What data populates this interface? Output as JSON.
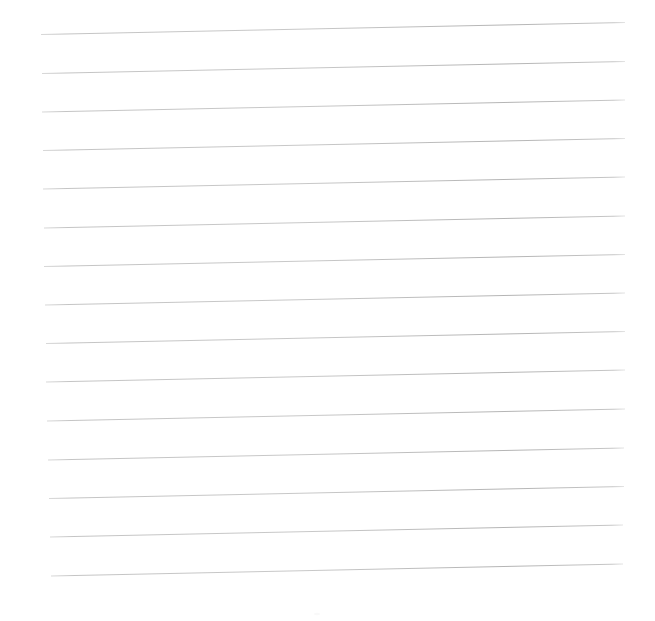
{
  "document": {
    "kind": "scanned-ruled-paper",
    "title": "Blank Ruled Paper",
    "page_label": "",
    "body_text": "",
    "width": 655,
    "height": 621
  },
  "colors": {
    "paper": "#ffffff",
    "rule_line": "#c2c2c2",
    "rule_line_strong": "#b0b0b0",
    "rule_line_faint": "#dcdcdc"
  },
  "ruling": {
    "type": "horizontal-ruled-lines",
    "count": 15,
    "spacing_px": 38.8,
    "stroke_width_px": 1,
    "skew_note": "lines rise slightly toward the right",
    "lines": [
      {
        "index": 1,
        "x1": 41,
        "y1": 34.5,
        "x2": 625,
        "y2": 22.5
      },
      {
        "index": 2,
        "x1": 42,
        "y1": 73.5,
        "x2": 625,
        "y2": 61.5
      },
      {
        "index": 3,
        "x1": 42,
        "y1": 112.0,
        "x2": 625,
        "y2": 100.0
      },
      {
        "index": 4,
        "x1": 43,
        "y1": 150.5,
        "x2": 625,
        "y2": 138.5
      },
      {
        "index": 5,
        "x1": 43,
        "y1": 189.0,
        "x2": 625,
        "y2": 177.0
      },
      {
        "index": 6,
        "x1": 44,
        "y1": 228.0,
        "x2": 625,
        "y2": 216.0
      },
      {
        "index": 7,
        "x1": 44,
        "y1": 266.5,
        "x2": 625,
        "y2": 254.5
      },
      {
        "index": 8,
        "x1": 45,
        "y1": 305.0,
        "x2": 625,
        "y2": 293.0
      },
      {
        "index": 9,
        "x1": 46,
        "y1": 343.5,
        "x2": 625,
        "y2": 331.5
      },
      {
        "index": 10,
        "x1": 46,
        "y1": 382.0,
        "x2": 625,
        "y2": 370.0
      },
      {
        "index": 11,
        "x1": 47,
        "y1": 421.0,
        "x2": 625,
        "y2": 409.0
      },
      {
        "index": 12,
        "x1": 48,
        "y1": 460.0,
        "x2": 624,
        "y2": 448.0
      },
      {
        "index": 13,
        "x1": 49,
        "y1": 498.5,
        "x2": 624,
        "y2": 486.5
      },
      {
        "index": 14,
        "x1": 50,
        "y1": 537.0,
        "x2": 623,
        "y2": 525.0
      },
      {
        "index": 15,
        "x1": 51,
        "y1": 576.0,
        "x2": 623,
        "y2": 564.0
      }
    ]
  },
  "margins": {
    "left_px": 41,
    "right_px": 30,
    "top_px": 22,
    "bottom_px": 45
  },
  "marks": [
    {
      "name": "faint-speck",
      "x": 317,
      "y": 614,
      "size": 3,
      "opacity": 0.07
    }
  ]
}
